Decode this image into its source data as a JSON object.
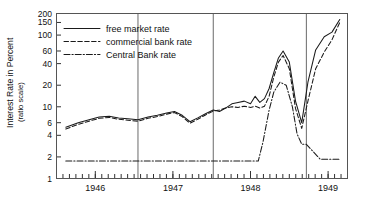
{
  "chart_data": {
    "type": "line",
    "title": "",
    "xlabel": "",
    "ylabel": "Interest Rate in Percent",
    "ylabel_sub": "(ratio scale)",
    "yscale": "log",
    "ylim": [
      1,
      200
    ],
    "xlim": [
      1945.5,
      1949.25
    ],
    "grid": false,
    "legend_position": "top-left-inside",
    "ytick_labels": [
      "200",
      "150",
      "100",
      "60",
      "40",
      "20",
      "10",
      "6",
      "4",
      "2",
      "1"
    ],
    "ytick_values": [
      200,
      150,
      100,
      60,
      40,
      20,
      10,
      6,
      4,
      2,
      1
    ],
    "xtick_labels": [
      "1946",
      "1947",
      "1948",
      "1949"
    ],
    "xtick_values": [
      1946,
      1947,
      1948,
      1949
    ],
    "annotations": {
      "vertical_dividers": [
        1946.55,
        1947.52,
        1948.72
      ]
    },
    "series": [
      {
        "name": "free market rate",
        "style": "solid",
        "x": [
          1945.62,
          1945.78,
          1945.92,
          1946.05,
          1946.18,
          1946.3,
          1946.42,
          1946.55,
          1946.68,
          1946.8,
          1946.92,
          1947.02,
          1947.12,
          1947.22,
          1947.32,
          1947.42,
          1947.52,
          1947.6,
          1947.68,
          1947.76,
          1947.84,
          1947.92,
          1948.0,
          1948.06,
          1948.12,
          1948.18,
          1948.24,
          1948.3,
          1948.36,
          1948.42,
          1948.5,
          1948.58,
          1948.66,
          1948.74,
          1948.84,
          1948.95,
          1949.05,
          1949.15
        ],
        "y": [
          5.2,
          6.0,
          6.6,
          7.2,
          7.4,
          7.0,
          6.8,
          6.6,
          7.2,
          7.6,
          8.2,
          8.6,
          7.6,
          6.2,
          7.0,
          8.0,
          9.0,
          8.6,
          9.6,
          11.0,
          11.5,
          12.0,
          11.0,
          14.0,
          11.5,
          13.0,
          18.0,
          30.0,
          48.0,
          60.0,
          42.0,
          12.0,
          6.0,
          22.0,
          62.0,
          95.0,
          110.0,
          165.0
        ]
      },
      {
        "name": "commercial bank rate",
        "style": "dashed",
        "x": [
          1945.62,
          1945.78,
          1945.92,
          1946.05,
          1946.18,
          1946.3,
          1946.42,
          1946.55,
          1946.68,
          1946.8,
          1946.92,
          1947.02,
          1947.12,
          1947.22,
          1947.32,
          1947.42,
          1947.52,
          1947.6,
          1947.68,
          1947.76,
          1947.84,
          1947.92,
          1948.0,
          1948.06,
          1948.12,
          1948.18,
          1948.24,
          1948.3,
          1948.36,
          1948.42,
          1948.5,
          1948.58,
          1948.66,
          1948.74,
          1948.84,
          1948.95,
          1949.05,
          1949.15
        ],
        "y": [
          4.9,
          5.7,
          6.3,
          6.9,
          7.1,
          6.7,
          6.5,
          6.3,
          6.9,
          7.3,
          7.9,
          8.3,
          7.3,
          5.9,
          6.7,
          7.7,
          8.7,
          9.0,
          9.6,
          10.0,
          9.8,
          10.2,
          9.8,
          10.2,
          9.6,
          10.2,
          14.0,
          26.0,
          42.0,
          52.0,
          34.0,
          9.5,
          5.0,
          12.0,
          34.0,
          58.0,
          86.0,
          150.0
        ]
      },
      {
        "name": "Central Bank rate",
        "style": "dash-dot",
        "x": [
          1945.62,
          1946.55,
          1947.52,
          1948.1,
          1948.16,
          1948.24,
          1948.3,
          1948.38,
          1948.46,
          1948.54,
          1948.6,
          1948.66,
          1948.72,
          1948.9,
          1949.15
        ],
        "y": [
          1.75,
          1.75,
          1.75,
          1.75,
          3.2,
          9.0,
          16.0,
          22.0,
          20.0,
          10.0,
          4.2,
          3.0,
          3.0,
          1.85,
          1.85
        ]
      }
    ]
  },
  "legend": {
    "entries": [
      {
        "label": "free market rate",
        "style": "solid"
      },
      {
        "label": "commercial bank rate",
        "style": "dashed"
      },
      {
        "label": "Central Bank rate",
        "style": "dash-dot"
      }
    ]
  }
}
